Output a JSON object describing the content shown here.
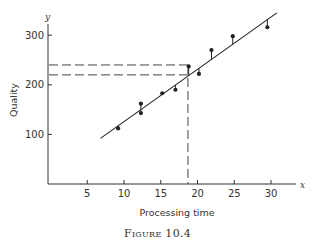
{
  "chart_data": {
    "type": "scatter",
    "title": "",
    "xlabel": "Processing time",
    "ylabel": "Quality",
    "x_axis_var": "x",
    "y_axis_var": "y",
    "xlim": [
      0,
      33
    ],
    "ylim": [
      0,
      320
    ],
    "x_ticks": [
      5,
      10,
      15,
      20,
      25,
      30
    ],
    "y_ticks": [
      100,
      200,
      300
    ],
    "grid": false,
    "legend": null,
    "points": [
      {
        "x": 9.2,
        "y": 112
      },
      {
        "x": 12.3,
        "y": 162
      },
      {
        "x": 12.3,
        "y": 143
      },
      {
        "x": 15.2,
        "y": 183
      },
      {
        "x": 17.0,
        "y": 190
      },
      {
        "x": 18.8,
        "y": 237
      },
      {
        "x": 20.2,
        "y": 222
      },
      {
        "x": 21.9,
        "y": 270
      },
      {
        "x": 24.8,
        "y": 298
      },
      {
        "x": 29.5,
        "y": 316
      }
    ],
    "fit_line": {
      "x_start": 6.8,
      "y_start": 92,
      "x_end": 30.8,
      "y_end": 345
    },
    "annotations": {
      "horizontal_dashed": [
        240,
        220
      ],
      "vertical_dashed": 18.7,
      "residual_lines": true
    }
  },
  "labels": {
    "x_title": "Processing time",
    "y_title": "Quality",
    "x_var": "x",
    "y_var": "y",
    "x_ticks": [
      "5",
      "10",
      "15",
      "20",
      "25",
      "30"
    ],
    "y_ticks": [
      "100",
      "200",
      "300"
    ],
    "caption": "Figure 10.4"
  }
}
